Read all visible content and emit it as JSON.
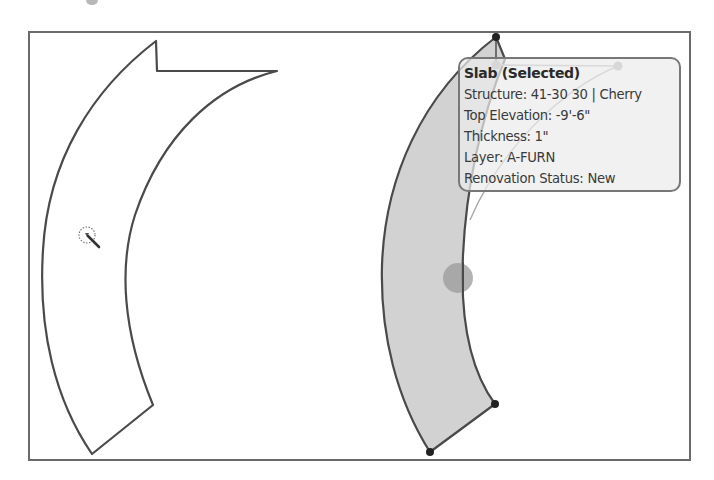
{
  "viewport": {
    "width": 714,
    "height": 480
  },
  "colors": {
    "frame": "#6a6a6a",
    "outline": "#4a4a4a",
    "selected_fill": "#d2d2d2",
    "grip": "#222222",
    "midpoint_grip": "#9a9a9a",
    "tooltip_border": "#777777"
  },
  "canvas": {
    "shapes": [
      {
        "name": "unselected-slab",
        "state": "unselected"
      },
      {
        "name": "selected-slab",
        "state": "selected"
      }
    ]
  },
  "cursor": {
    "icon": "magic-wand-select-cursor"
  },
  "tooltip": {
    "title": "Slab (Selected)",
    "rows": [
      "Structure: 41-30 30 | Cherry",
      "Top Elevation: -9'-6\"",
      "Thickness: 1\"",
      "Layer: A-FURN",
      "Renovation Status: New"
    ]
  }
}
